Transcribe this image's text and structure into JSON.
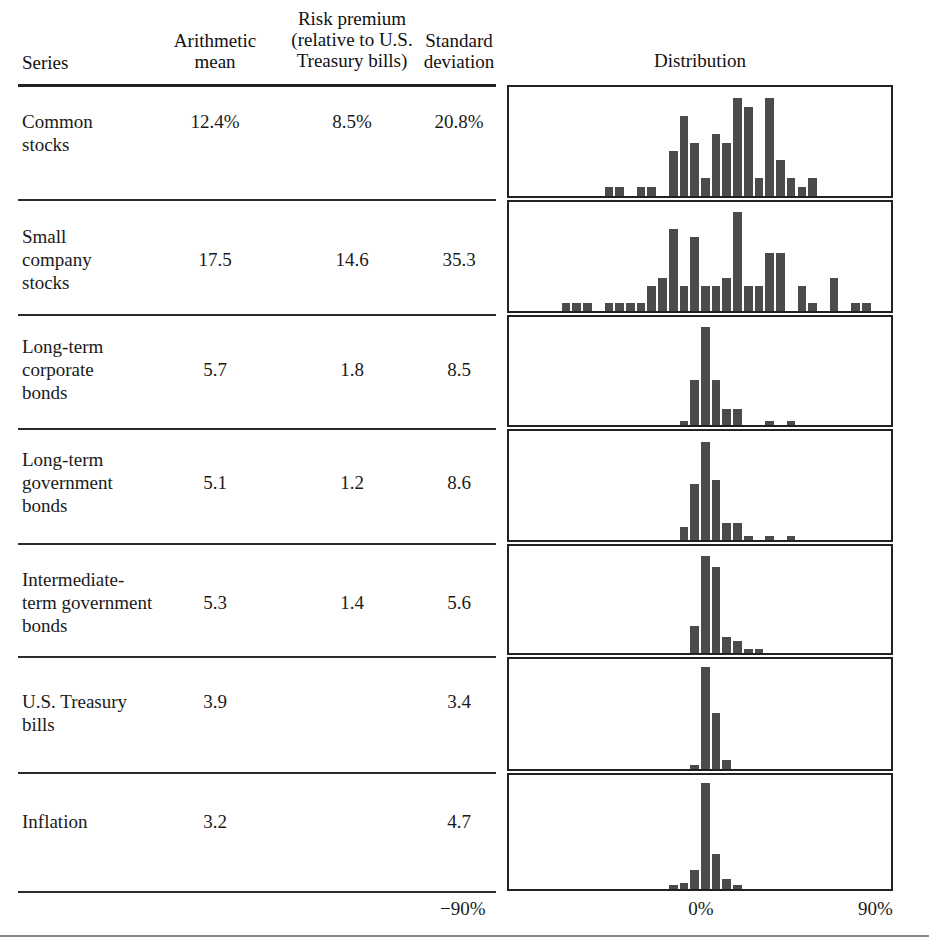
{
  "header": {
    "series": "Series",
    "arithmetic_mean": "Arithmetic\nmean",
    "arithmetic_mean_l1": "Arithmetic",
    "arithmetic_mean_l2": "mean",
    "risk_premium_l1": "Risk premium",
    "risk_premium_l2": "(relative to U.S.",
    "risk_premium_l3": "Treasury bills)",
    "std_dev_l1": "Standard",
    "std_dev_l2": "deviation",
    "distribution": "Distribution"
  },
  "axis": {
    "left_label": "−90%",
    "center_label": "0%",
    "right_label": "90%",
    "min": -90,
    "max": 90,
    "unit": "%"
  },
  "colors": {
    "bar": "#4b4b4b",
    "rule": "#2c2c2c",
    "text": "#1a1a1a",
    "page": "#ffffff"
  },
  "rows": [
    {
      "label_l1": "Common",
      "label_l2": "stocks",
      "label_l3": "",
      "arithmetic_mean": "12.4%",
      "risk_premium": "8.5%",
      "standard_deviation": "20.8%"
    },
    {
      "label_l1": "Small",
      "label_l2": "company",
      "label_l3": "stocks",
      "arithmetic_mean": "17.5",
      "risk_premium": "14.6",
      "standard_deviation": "35.3"
    },
    {
      "label_l1": "Long-term",
      "label_l2": "corporate",
      "label_l3": "bonds",
      "arithmetic_mean": "5.7",
      "risk_premium": "1.8",
      "standard_deviation": "8.5"
    },
    {
      "label_l1": "Long-term",
      "label_l2": "government",
      "label_l3": "bonds",
      "arithmetic_mean": "5.1",
      "risk_premium": "1.2",
      "standard_deviation": "8.6"
    },
    {
      "label_l1": "Intermediate-",
      "label_l2": "term government",
      "label_l3": "bonds",
      "arithmetic_mean": "5.3",
      "risk_premium": "1.4",
      "standard_deviation": "5.6"
    },
    {
      "label_l1": "U.S. Treasury",
      "label_l2": "bills",
      "label_l3": "",
      "arithmetic_mean": "3.9",
      "risk_premium": "",
      "standard_deviation": "3.4"
    },
    {
      "label_l1": "Inflation",
      "label_l2": "",
      "label_l3": "",
      "arithmetic_mean": "3.2",
      "risk_premium": "",
      "standard_deviation": "4.7"
    }
  ],
  "chart_data": [
    {
      "type": "bar",
      "title": "Common stocks",
      "xlabel": "Annual rate of return (%)",
      "ylabel": "Frequency",
      "xlim": [
        -90,
        90
      ],
      "grid": false,
      "bin_width": 5,
      "bin_centers": [
        -42.5,
        -37.5,
        -27.5,
        -22.5,
        -12.5,
        -7.5,
        -2.5,
        2.5,
        7.5,
        12.5,
        17.5,
        22.5,
        27.5,
        32.5,
        37.5,
        42.5,
        47.5,
        52.5
      ],
      "values": [
        1,
        1,
        1,
        1,
        5,
        9,
        6,
        2,
        7,
        6,
        11,
        10,
        2,
        11,
        4,
        2,
        1,
        2
      ]
    },
    {
      "type": "bar",
      "title": "Small company stocks",
      "xlabel": "Annual rate of return (%)",
      "ylabel": "Frequency",
      "xlim": [
        -90,
        90
      ],
      "grid": false,
      "bin_width": 5,
      "bin_centers": [
        -62.5,
        -57.5,
        -52.5,
        -42.5,
        -37.5,
        -32.5,
        -27.5,
        -22.5,
        -17.5,
        -12.5,
        -7.5,
        -2.5,
        2.5,
        7.5,
        12.5,
        17.5,
        22.5,
        27.5,
        32.5,
        37.5,
        47.5,
        52.5,
        62.5,
        72.5,
        77.5
      ],
      "values": [
        1,
        1,
        1,
        1,
        1,
        1,
        1,
        3,
        4,
        10,
        3,
        9,
        3,
        3,
        4,
        12,
        3,
        3,
        7,
        7,
        3,
        1,
        4,
        1,
        1,
        1
      ]
    },
    {
      "type": "bar",
      "title": "Long-term corporate bonds",
      "xlabel": "Annual rate of return (%)",
      "ylabel": "Frequency",
      "xlim": [
        -90,
        90
      ],
      "grid": false,
      "bin_width": 5,
      "bin_centers": [
        -7.5,
        -2.5,
        2.5,
        7.5,
        12.5,
        17.5,
        32.5,
        42.5
      ],
      "values": [
        1,
        11,
        24,
        11,
        4,
        4,
        1,
        1
      ]
    },
    {
      "type": "bar",
      "title": "Long-term government bonds",
      "xlabel": "Annual rate of return (%)",
      "ylabel": "Frequency",
      "xlim": [
        -90,
        90
      ],
      "grid": false,
      "bin_width": 5,
      "bin_centers": [
        -7.5,
        -2.5,
        2.5,
        7.5,
        12.5,
        17.5,
        22.5,
        32.5,
        42.5
      ],
      "values": [
        3,
        13,
        23,
        14,
        4,
        4,
        1,
        1,
        1
      ]
    },
    {
      "type": "bar",
      "title": "Intermediate-term government bonds",
      "xlabel": "Annual rate of return (%)",
      "ylabel": "Frequency",
      "xlim": [
        -90,
        90
      ],
      "grid": false,
      "bin_width": 5,
      "bin_centers": [
        -2.5,
        2.5,
        7.5,
        12.5,
        17.5,
        22.5,
        27.5
      ],
      "values": [
        7,
        25,
        22,
        4,
        3,
        1,
        1
      ]
    },
    {
      "type": "bar",
      "title": "U.S. Treasury bills",
      "xlabel": "Annual rate of return (%)",
      "ylabel": "Frequency",
      "xlim": [
        -90,
        90
      ],
      "grid": false,
      "bin_width": 5,
      "bin_centers": [
        -2.5,
        2.5,
        7.5,
        12.5
      ],
      "values": [
        1,
        33,
        18,
        3
      ]
    },
    {
      "type": "bar",
      "title": "Inflation",
      "xlabel": "Annual rate of return (%)",
      "ylabel": "Frequency",
      "xlim": [
        -90,
        90
      ],
      "grid": false,
      "bin_width": 5,
      "bin_centers": [
        -12.5,
        -7.5,
        -2.5,
        2.5,
        7.5,
        12.5,
        17.5
      ],
      "values": [
        1,
        2,
        6,
        33,
        11,
        3,
        1
      ]
    }
  ],
  "layout": {
    "panel_geometry": [
      {
        "top": 85,
        "height": 113,
        "max": 12
      },
      {
        "top": 200,
        "height": 113,
        "max": 13
      },
      {
        "top": 315,
        "height": 112,
        "max": 26
      },
      {
        "top": 429,
        "height": 113,
        "max": 25
      },
      {
        "top": 544,
        "height": 111,
        "max": 27
      },
      {
        "top": 657,
        "height": 114,
        "max": 35
      },
      {
        "top": 773,
        "height": 118,
        "max": 35
      }
    ],
    "rules_y": [
      84,
      199,
      314,
      428,
      543,
      656,
      772,
      891
    ],
    "label_y": [
      110,
      225,
      335,
      448,
      568,
      690,
      810
    ]
  }
}
